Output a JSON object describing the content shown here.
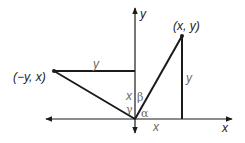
{
  "diagram": {
    "title": "",
    "axes": {
      "x_label": "x",
      "y_label": "y"
    },
    "points": [
      {
        "label": "(x, y)",
        "role": "rotated-from"
      },
      {
        "label": "(−y, x)",
        "role": "rotated-to"
      }
    ],
    "segment_labels": {
      "horizontal_top": "y",
      "vertical_right": "y",
      "vertical_on_y_axis": "x",
      "horizontal_on_x_axis": "x"
    },
    "angles": {
      "alpha": "α",
      "beta": "β",
      "gamma": "γ"
    },
    "colors": {
      "line": "#1a1a1a",
      "label_gray": "#6a6a6a"
    }
  }
}
